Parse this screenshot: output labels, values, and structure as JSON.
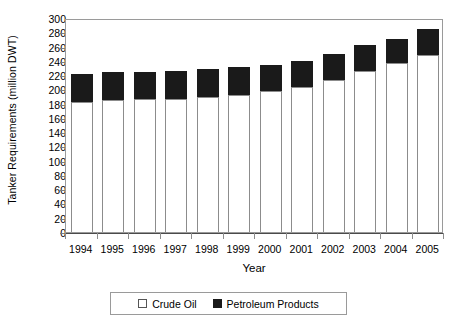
{
  "chart_data": {
    "type": "bar",
    "subtype": "stacked-vertical",
    "title": "",
    "xlabel": "Year",
    "ylabel": "Tanker Requirements (million DWT)",
    "categories": [
      "1994",
      "1995",
      "1996",
      "1997",
      "1998",
      "1999",
      "2000",
      "2001",
      "2002",
      "2003",
      "2004",
      "2005"
    ],
    "series": [
      {
        "name": "Crude Oil",
        "color": "#ffffff",
        "values": [
          182,
          185,
          187,
          187,
          189,
          192,
          197,
          203,
          213,
          226,
          237,
          248
        ]
      },
      {
        "name": "Petroleum Products",
        "color": "#1a1a1a",
        "values": [
          39,
          40,
          38,
          39,
          39,
          40,
          37,
          37,
          37,
          36,
          34,
          36
        ]
      }
    ],
    "totals": [
      221,
      225,
      225,
      226,
      228,
      232,
      234,
      240,
      250,
      262,
      271,
      284
    ],
    "ylim": [
      0,
      300
    ],
    "ytick_step": 20,
    "yticks": [
      300,
      280,
      260,
      240,
      220,
      200,
      180,
      160,
      140,
      120,
      100,
      80,
      60,
      40,
      20,
      0
    ],
    "grid": false,
    "legend_position": "bottom"
  },
  "legend": {
    "items": [
      {
        "label": "Crude Oil",
        "swatch": "white-square-icon"
      },
      {
        "label": "Petroleum Products",
        "swatch": "black-square-icon"
      }
    ]
  }
}
